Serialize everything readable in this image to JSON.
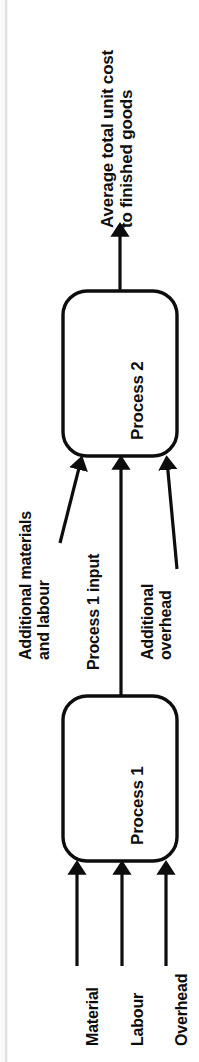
{
  "diagram": {
    "orientation": "rotated-90-ccw",
    "stroke_color": "#0d0d0d",
    "background_color": "#ffffff",
    "output": {
      "label_line1": "Average total unit cost",
      "label_line2": "to finished goods",
      "arrow_name": "output-arrow"
    },
    "processes": [
      {
        "id": "process-2",
        "label": "Process 2"
      },
      {
        "id": "process-1",
        "label": "Process 1"
      }
    ],
    "mid_inputs": [
      {
        "id": "additional-materials-and-labour",
        "line1": "Additional materials",
        "line2": "and labour"
      },
      {
        "id": "process-1-input",
        "line1": "Process 1 input",
        "line2": ""
      },
      {
        "id": "additional-overhead",
        "line1": "Additional",
        "line2": "overhead"
      }
    ],
    "bottom_inputs": [
      {
        "id": "material",
        "label": "Material"
      },
      {
        "id": "labour",
        "label": "Labour"
      },
      {
        "id": "overhead",
        "label": "Overhead"
      }
    ]
  }
}
